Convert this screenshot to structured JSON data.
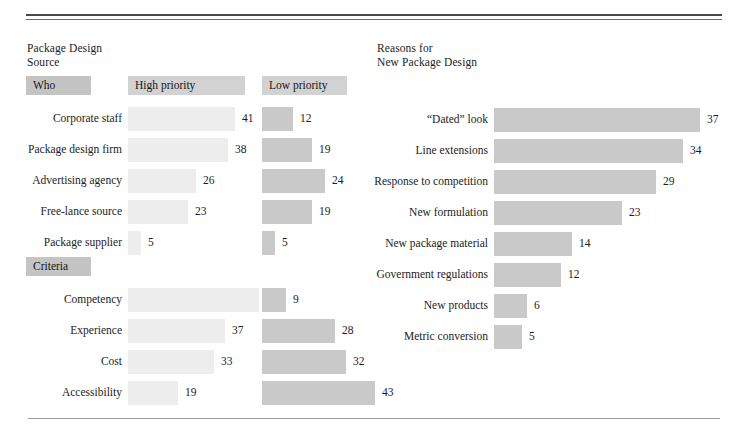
{
  "chart_data": [
    {
      "type": "bar",
      "title": "Package Design Source",
      "orientation": "horizontal",
      "groups": [
        {
          "group_label": "Who",
          "categories": [
            "Corporate staff",
            "Package design firm",
            "Advertising agency",
            "Free-lance source",
            "Package supplier"
          ],
          "series": [
            {
              "name": "High priority",
              "values": [
                41,
                38,
                26,
                23,
                5
              ]
            },
            {
              "name": "Low priority",
              "values": [
                12,
                19,
                24,
                19,
                5
              ]
            }
          ]
        },
        {
          "group_label": "Criteria",
          "categories": [
            "Competency",
            "Experience",
            "Cost",
            "Accessibility"
          ],
          "series": [
            {
              "name": "High priority",
              "values": [
                50,
                37,
                33,
                19
              ]
            },
            {
              "name": "Low priority",
              "values": [
                9,
                28,
                32,
                43
              ]
            }
          ]
        }
      ],
      "xlabel": "",
      "ylabel": "",
      "grid": false,
      "legend": "column-headers"
    },
    {
      "type": "bar",
      "title": "Reasons for New Package Design",
      "orientation": "horizontal",
      "categories": [
        "“Dated” look",
        "Line extensions",
        "Response to competition",
        "New formulation",
        "New package material",
        "Government regulations",
        "New products",
        "Metric conversion"
      ],
      "values": [
        37,
        34,
        29,
        23,
        14,
        12,
        6,
        5
      ],
      "xlabel": "",
      "ylabel": "",
      "grid": false,
      "legend": "none"
    }
  ],
  "colors": {
    "high_priority_bar": "#ededed",
    "low_priority_bar": "#c9c9c9",
    "right_bar": "#c9c9c9",
    "chip_dark": "#c4c4c4",
    "chip_light": "#d2d2d2",
    "rule": "#4a4a4a",
    "text": "#1c1c1c",
    "background": "#ffffff"
  },
  "left_panel": {
    "title": "Package Design\nSource",
    "headers": {
      "who": "Who",
      "criteria": "Criteria",
      "high": "High priority",
      "low": "Low priority"
    },
    "who_rows": [
      {
        "label": "Corporate staff",
        "high": "41",
        "low": "12"
      },
      {
        "label": "Package design firm",
        "high": "38",
        "low": "19"
      },
      {
        "label": "Advertising agency",
        "high": "26",
        "low": "24"
      },
      {
        "label": "Free-lance source",
        "high": "23",
        "low": "19"
      },
      {
        "label": "Package supplier",
        "high": "5",
        "low": "5"
      }
    ],
    "criteria_rows": [
      {
        "label": "Competency",
        "high": "50",
        "low": "9"
      },
      {
        "label": "Experience",
        "high": "37",
        "low": "28"
      },
      {
        "label": "Cost",
        "high": "33",
        "low": "32"
      },
      {
        "label": "Accessibility",
        "high": "19",
        "low": "43"
      }
    ]
  },
  "right_panel": {
    "title": "Reasons for\nNew Package Design",
    "rows": [
      {
        "label": "“Dated” look",
        "value": "37"
      },
      {
        "label": "Line extensions",
        "value": "34"
      },
      {
        "label": "Response to competition",
        "value": "29"
      },
      {
        "label": "New formulation",
        "value": "23"
      },
      {
        "label": "New package material",
        "value": "14"
      },
      {
        "label": "Government regulations",
        "value": "12"
      },
      {
        "label": "New products",
        "value": "6"
      },
      {
        "label": "Metric conversion",
        "value": "5"
      }
    ]
  }
}
